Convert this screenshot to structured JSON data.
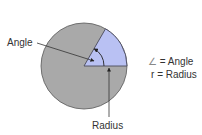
{
  "diagram": {
    "labels": {
      "angle": "Angle",
      "radius": "Radius"
    },
    "legend": [
      {
        "symbol": "∠",
        "text": "= Angle"
      },
      {
        "symbol": "r",
        "text": "= Radius"
      }
    ],
    "colors": {
      "circle_fill": "#a9a9a9",
      "sector_fill": "#b9c1f3",
      "stroke": "#4a4a5a"
    }
  }
}
